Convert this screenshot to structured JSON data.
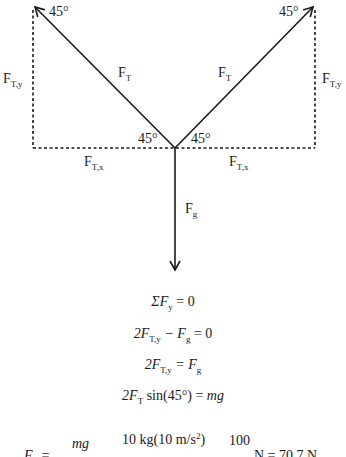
{
  "diagram": {
    "vectors": {
      "left_tension": {
        "label": "F",
        "sub": "T",
        "angle_at_tip": "45°",
        "angle_at_origin": "45°"
      },
      "right_tension": {
        "label": "F",
        "sub": "T",
        "angle_at_tip": "45°",
        "angle_at_origin": "45°"
      },
      "gravity": {
        "label": "F",
        "sub": "g"
      }
    },
    "components": {
      "left_y": {
        "label": "F",
        "sub": "T,y"
      },
      "right_y": {
        "label": "F",
        "sub": "T,y"
      },
      "left_x": {
        "label": "F",
        "sub": "T,x"
      },
      "right_x": {
        "label": "F",
        "sub": "T,x"
      }
    },
    "colors": {
      "line": "#1a1a1a",
      "text": "#1a1a1a",
      "background": "#ffffff"
    }
  },
  "equations": [
    {
      "id": "sum",
      "lhs": "ΣF",
      "lhs_sub": "y",
      "rhs": "= 0"
    },
    {
      "id": "expand",
      "a": "2F",
      "a_sub": "T,y",
      "op": " − F",
      "b_sub": "g",
      "rhs": " = 0"
    },
    {
      "id": "equal",
      "a": "2F",
      "a_sub": "T,y",
      "mid": " = F",
      "b_sub": "g"
    },
    {
      "id": "sin",
      "a": "2F",
      "a_sub": "T",
      "mid": " sin(45°) = ",
      "rhs": "mg"
    },
    {
      "id": "solve",
      "lhs": "F",
      "lhs_sub": "T",
      "eq1": " = ",
      "f1_num": "mg",
      "f2_num": "10 kg(10 m/s",
      "f2_sup": "2",
      "f2_close": ")",
      "f3_num": "100",
      "tail": " N = 70.7 N"
    }
  ]
}
